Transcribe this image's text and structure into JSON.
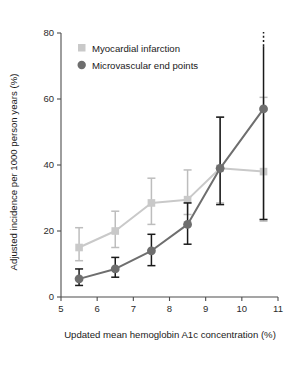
{
  "chart_data": {
    "type": "line",
    "title": "",
    "xlabel": "Updated mean hemoglobin A1c concentration (%)",
    "ylabel": "Adjusted incidence per 1000 person years (%)",
    "xlim": [
      5,
      11
    ],
    "ylim": [
      0,
      80
    ],
    "xticks": [
      5,
      6,
      7,
      8,
      9,
      10,
      11
    ],
    "xtick_labels": [
      "5",
      "6",
      "7",
      "8",
      "9",
      "10",
      "11"
    ],
    "yticks": [
      0,
      20,
      40,
      60,
      80
    ],
    "ytick_labels": [
      "0",
      "20",
      "40",
      "60",
      "80"
    ],
    "grid": false,
    "legend_position": "upper-left",
    "x": [
      5.5,
      6.5,
      7.5,
      8.5,
      9.4,
      10.6
    ],
    "series": [
      {
        "name": "Myocardial infarction",
        "marker": "square",
        "color": "#c9c9c9",
        "errorbar_color": "#bdbdbd",
        "values": [
          15.0,
          20.0,
          28.5,
          29.5,
          39.0,
          38.0
        ],
        "ci_low": [
          11.0,
          15.0,
          22.0,
          25.0,
          28.5,
          23.0
        ],
        "ci_high": [
          21.0,
          26.0,
          36.0,
          38.5,
          54.5,
          60.5
        ],
        "ci_high_open": [
          false,
          false,
          false,
          false,
          false,
          false
        ]
      },
      {
        "name": "Microvascular end points",
        "marker": "circle",
        "color": "#6e6e6e",
        "errorbar_color": "#1a1a1a",
        "values": [
          5.5,
          8.5,
          14.0,
          22.0,
          39.0,
          57.0
        ],
        "ci_low": [
          3.5,
          6.0,
          9.5,
          16.0,
          28.0,
          23.5
        ],
        "ci_high": [
          8.5,
          12.0,
          19.0,
          28.5,
          54.5,
          76.0
        ],
        "ci_high_open": [
          false,
          false,
          false,
          false,
          false,
          true
        ]
      }
    ]
  },
  "legend": {
    "entries": [
      {
        "label": "Myocardial infarction",
        "swatch": "square",
        "color": "#c9c9c9"
      },
      {
        "label": "Microvascular end points",
        "swatch": "circle",
        "color": "#6e6e6e"
      }
    ]
  },
  "colors": {
    "myocardial_infarction": "#c9c9c9",
    "microvascular_end_points": "#6e6e6e",
    "axis": "#4d4d4d",
    "background": "#ffffff"
  }
}
